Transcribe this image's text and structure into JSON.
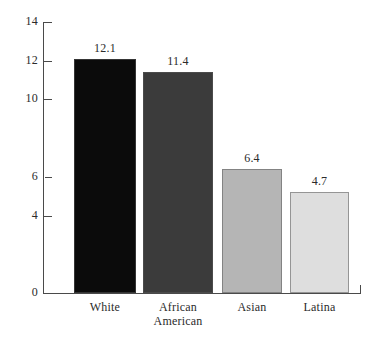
{
  "chart_data": {
    "type": "bar",
    "title": "",
    "subtitle": "",
    "xlabel": "",
    "ylabel": "",
    "categories": [
      "White",
      "African\nAmerican",
      "Asian",
      "Latina"
    ],
    "values": [
      12.1,
      11.4,
      6.4,
      4.7
    ],
    "value_labels": [
      "12.1",
      "11.4",
      "6.4",
      "4.7"
    ],
    "plotted_heights": [
      12.1,
      11.4,
      6.4,
      5.2
    ],
    "bar_colors": [
      "#0b0b0b",
      "#3b3b3b",
      "#b5b5b5",
      "#dedede"
    ],
    "ylim": [
      0,
      14
    ],
    "y_ticks": [
      0,
      4,
      6,
      10,
      12,
      14
    ],
    "y_tick_labels": [
      "0",
      "4",
      "6",
      "10",
      "12",
      "14"
    ],
    "grid": false,
    "legend": false,
    "legend_position": "none",
    "background_color": "#ffffff",
    "axis_color": "#4a4a4a",
    "text_color": "#2b2b2b"
  }
}
